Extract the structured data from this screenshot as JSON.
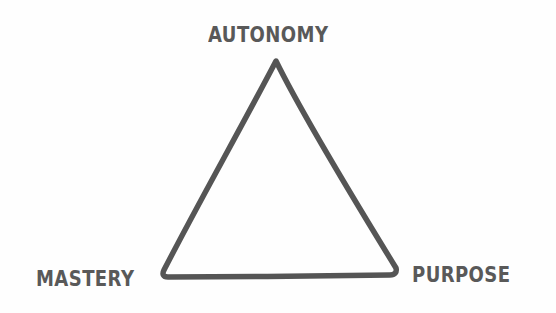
{
  "diagram": {
    "type": "triangle",
    "stroke_color": "#555555",
    "text_color": "#595959",
    "background": "#fefefe",
    "vertices": {
      "top": {
        "label": "AUTONOMY"
      },
      "bottom_left": {
        "label": "MASTERY"
      },
      "bottom_right": {
        "label": "PURPOSE"
      }
    }
  }
}
